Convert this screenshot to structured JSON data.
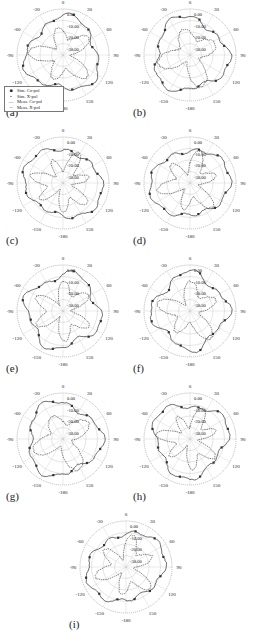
{
  "figure": {
    "panels": [
      {
        "id": "a",
        "label": "(a)",
        "x": 0,
        "y": 0,
        "seed": 1,
        "legend": true
      },
      {
        "id": "b",
        "label": "(b)",
        "x": 127,
        "y": 0,
        "seed": 2,
        "legend": false
      },
      {
        "id": "c",
        "label": "(c)",
        "x": 0,
        "y": 128,
        "seed": 3,
        "legend": false
      },
      {
        "id": "d",
        "label": "(d)",
        "x": 127,
        "y": 128,
        "seed": 4,
        "legend": false
      },
      {
        "id": "e",
        "label": "(e)",
        "x": 0,
        "y": 256,
        "seed": 5,
        "legend": false
      },
      {
        "id": "f",
        "label": "(f)",
        "x": 127,
        "y": 256,
        "seed": 6,
        "legend": false
      },
      {
        "id": "g",
        "label": "(g)",
        "x": 0,
        "y": 384,
        "seed": 7,
        "legend": false
      },
      {
        "id": "h",
        "label": "(h)",
        "x": 127,
        "y": 384,
        "seed": 8,
        "legend": false
      },
      {
        "id": "i",
        "label": "(i)",
        "x": 63,
        "y": 512,
        "seed": 9,
        "legend": false
      }
    ],
    "legend": {
      "items": [
        {
          "symbol": "■",
          "label": "Sim. Co-pol"
        },
        {
          "symbol": "•",
          "label": "Sim. X-pol"
        },
        {
          "symbol": "—",
          "label": "Meas. Co-pol"
        },
        {
          "symbol": "--",
          "label": "Meas. X-pol"
        }
      ]
    },
    "colors": {
      "line": "#333333",
      "grid": "#bbbbbb",
      "outer_ring": "#999999",
      "text": "#222222"
    }
  },
  "chart_data": [
    {
      "type": "polar-line",
      "panel": "(a)",
      "title": "",
      "radial_ticks": [
        "0.00",
        "-10.00",
        "-20.00",
        "-30.00"
      ],
      "angle_ticks": [
        "0",
        "30",
        "60",
        "90",
        "120",
        "150",
        "-180",
        "-150",
        "-120",
        "-90",
        "-60",
        "-30"
      ],
      "rlim": [
        -40,
        0
      ],
      "series": [
        {
          "name": "Sim. Co-pol",
          "style": "square markers"
        },
        {
          "name": "Sim. X-pol",
          "style": "dot markers"
        },
        {
          "name": "Meas. Co-pol",
          "style": "solid"
        },
        {
          "name": "Meas. X-pol",
          "style": "dashed"
        }
      ],
      "legend_position": "lower-left"
    },
    {
      "type": "polar-line",
      "panel": "(b)",
      "radial_ticks": [
        "0.00",
        "-10.00",
        "-20.00",
        "-30.00"
      ],
      "angle_ticks": [
        "0",
        "30",
        "60",
        "90",
        "120",
        "150",
        "-180",
        "-150",
        "-120",
        "-90",
        "-60",
        "-30"
      ],
      "rlim": [
        -40,
        0
      ]
    },
    {
      "type": "polar-line",
      "panel": "(c)",
      "radial_ticks": [
        "0.00",
        "-10.00",
        "-20.00",
        "-30.00"
      ],
      "angle_ticks": [
        "0",
        "30",
        "60",
        "90",
        "120",
        "150",
        "-180",
        "-150",
        "-120",
        "-90",
        "-60",
        "-30"
      ],
      "rlim": [
        -40,
        0
      ]
    },
    {
      "type": "polar-line",
      "panel": "(d)",
      "radial_ticks": [
        "0.00",
        "-10.00",
        "-20.00",
        "-30.00"
      ],
      "angle_ticks": [
        "0",
        "30",
        "60",
        "90",
        "120",
        "150",
        "-180",
        "-150",
        "-120",
        "-90",
        "-60",
        "-30"
      ],
      "rlim": [
        -40,
        0
      ]
    },
    {
      "type": "polar-line",
      "panel": "(e)",
      "radial_ticks": [
        "0.00",
        "-10.00",
        "-20.00",
        "-30.00"
      ],
      "angle_ticks": [
        "0",
        "30",
        "60",
        "90",
        "120",
        "150",
        "-180",
        "-150",
        "-120",
        "-90",
        "-60",
        "-30"
      ],
      "rlim": [
        -40,
        0
      ]
    },
    {
      "type": "polar-line",
      "panel": "(f)",
      "radial_ticks": [
        "0.00",
        "-10.00",
        "-20.00",
        "-30.00"
      ],
      "angle_ticks": [
        "0",
        "30",
        "60",
        "90",
        "120",
        "150",
        "-180",
        "-150",
        "-120",
        "-90",
        "-60",
        "-30"
      ],
      "rlim": [
        -40,
        0
      ]
    },
    {
      "type": "polar-line",
      "panel": "(g)",
      "radial_ticks": [
        "0.00",
        "-10.00",
        "-20.00",
        "-30.00"
      ],
      "angle_ticks": [
        "0",
        "30",
        "60",
        "90",
        "120",
        "150",
        "-180",
        "-150",
        "-120",
        "-90",
        "-60",
        "-30"
      ],
      "rlim": [
        -40,
        0
      ]
    },
    {
      "type": "polar-line",
      "panel": "(h)",
      "radial_ticks": [
        "0.00",
        "-10.00",
        "-20.00",
        "-30.00"
      ],
      "angle_ticks": [
        "0",
        "30",
        "60",
        "90",
        "120",
        "150",
        "-180",
        "-150",
        "-120",
        "-90",
        "-60",
        "-30"
      ],
      "rlim": [
        -40,
        0
      ]
    },
    {
      "type": "polar-line",
      "panel": "(i)",
      "radial_ticks": [
        "0.00",
        "-10.00",
        "-20.00",
        "-30.00"
      ],
      "angle_ticks": [
        "0",
        "30",
        "60",
        "90",
        "120",
        "150",
        "-180",
        "-150",
        "-120",
        "-90",
        "-60",
        "-30"
      ],
      "rlim": [
        -40,
        0
      ]
    }
  ]
}
